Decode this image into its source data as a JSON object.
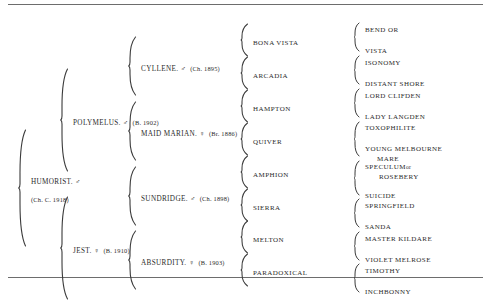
{
  "document": {
    "type": "pedigree-chart",
    "subject": "HUMORIST",
    "generations": 5
  },
  "generation1": [
    {
      "name": "HUMORIST. ♂",
      "detail": "(Ch. C. 1918)"
    }
  ],
  "generation2": [
    {
      "name": "POLYMELUS. ♂",
      "detail": "(B. 1902)"
    },
    {
      "name": "JEST. ♀",
      "detail": "(B. 1910)"
    }
  ],
  "generation3": [
    {
      "name": "CYLLENE. ♂",
      "detail": "(Ch. 1895)"
    },
    {
      "name": "MAID MARIAN. ♀",
      "detail": "(Br. 1886)"
    },
    {
      "name": "SUNDRIDGE. ♂",
      "detail": "(Ch. 1898)"
    },
    {
      "name": "ABSURDITY. ♀",
      "detail": "(B. 1903)"
    }
  ],
  "generation4": [
    {
      "name": "BONA VISTA"
    },
    {
      "name": "ARCADIA"
    },
    {
      "name": "HAMPTON"
    },
    {
      "name": "QUIVER"
    },
    {
      "name": "AMPHION"
    },
    {
      "name": "SIERRA"
    },
    {
      "name": "MELTON"
    },
    {
      "name": "PARADOXICAL"
    }
  ],
  "generation5": [
    {
      "name": "BEND OR"
    },
    {
      "name": "VISTA"
    },
    {
      "name": "ISONOMY"
    },
    {
      "name": "DISTANT SHORE"
    },
    {
      "name": "LORD CLIFDEN"
    },
    {
      "name": "LADY LANGDEN"
    },
    {
      "name": "TOXOPHILITE"
    },
    {
      "name": "YOUNG MELBOURNE",
      "name_line2": "MARE"
    },
    {
      "name": "SPECULUM",
      "or": "or",
      "name_line2": "ROSEBERY"
    },
    {
      "name": "SUICIDE"
    },
    {
      "name": "SPRINGFIELD"
    },
    {
      "name": "SANDA"
    },
    {
      "name": "MASTER KILDARE"
    },
    {
      "name": "VIOLET MELROSE"
    },
    {
      "name": "TIMOTHY"
    },
    {
      "name": "INCHBONNY"
    }
  ]
}
